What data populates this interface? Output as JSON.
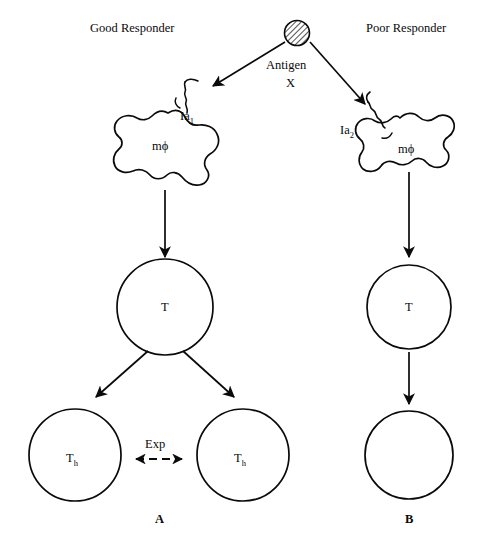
{
  "figure": {
    "type": "immunology-schematic",
    "background": "#ffffff",
    "ink": "#0a0a0a"
  },
  "antigen": {
    "label_line1": "Antigen",
    "label_line2": "X",
    "icon": "hatched-circle",
    "fill_pattern": "diagonal-hatch"
  },
  "columns": [
    {
      "id": "good",
      "header": "Good Responder",
      "macrophage_label": "mϕ",
      "ia_label": "Ia",
      "ia_subscript": "1",
      "tcell_label": "T",
      "panel_label": "A",
      "progeny": [
        {
          "label": "T",
          "subscript": "h"
        },
        {
          "label": "T",
          "subscript": "h"
        }
      ],
      "interaction_label": "Exp"
    },
    {
      "id": "poor",
      "header": "Poor Responder",
      "macrophage_label": "mϕ",
      "ia_label": "Ia",
      "ia_subscript": "2",
      "tcell_label": "T",
      "panel_label": "B",
      "progeny": [
        {
          "label": "",
          "subscript": ""
        }
      ],
      "interaction_label": ""
    }
  ]
}
